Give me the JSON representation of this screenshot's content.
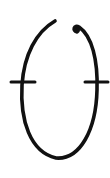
{
  "glyph": {
    "description": "Hand-drawn open oval symbol with two horizontal tick marks",
    "stroke_color": "#111111",
    "background_color": "#ffffff"
  }
}
